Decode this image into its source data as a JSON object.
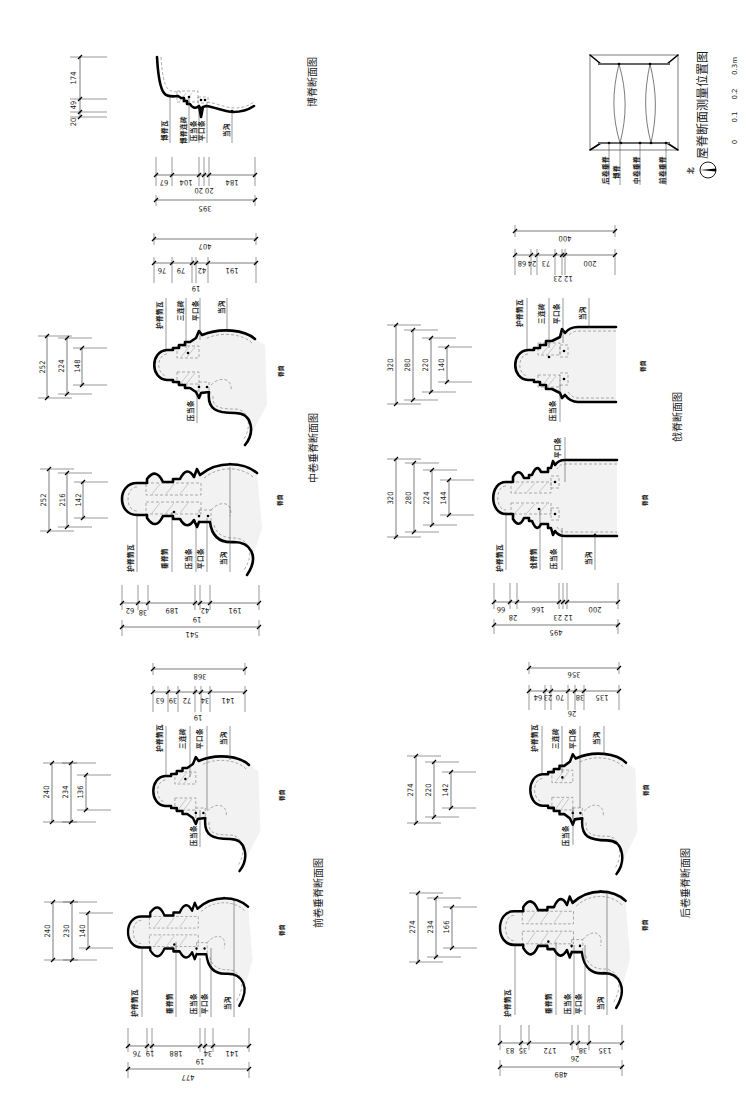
{
  "sheet": {
    "boji": {
      "title": "博脊断面图",
      "labels": [
        "博脊瓦",
        "博脊连砖",
        "压当条",
        "平口条",
        "当沟"
      ],
      "height_dims": [
        "174",
        "49",
        "20"
      ],
      "width_dims": [
        "67",
        "104",
        "20 20",
        "184"
      ],
      "width_total": "395"
    },
    "zhongjuan": {
      "title": "中卷垂脊断面图",
      "short": {
        "labels": [
          "护脊筒瓦",
          "三连砖",
          "平口条",
          "当沟",
          "压当条"
        ],
        "body_label": "脊筒",
        "height_dims": [
          "252",
          "224",
          "148"
        ],
        "width_dims": [
          "76",
          "79",
          "42",
          "191"
        ],
        "width_sub": "19",
        "width_total": "407"
      },
      "long": {
        "labels": [
          "护脊筒瓦",
          "垂脊筒",
          "压当条",
          "平口条",
          "当沟"
        ],
        "body_label": "脊筒",
        "height_dims": [
          "252",
          "216",
          "142"
        ],
        "width_dims": [
          "62",
          "38",
          "189",
          "42",
          "191"
        ],
        "width_sub": "19",
        "width_total": "541"
      }
    },
    "qianjuan": {
      "title": "前卷垂脊断面图",
      "short": {
        "labels": [
          "护脊筒瓦",
          "三连砖",
          "平口条",
          "当沟",
          "压当条"
        ],
        "body_label": "脊筒",
        "height_dims": [
          "240",
          "234",
          "136"
        ],
        "width_dims": [
          "63",
          "39",
          "72",
          "34",
          "141"
        ],
        "width_sub": "19",
        "width_total": "368"
      },
      "long": {
        "labels": [
          "护脊筒瓦",
          "垂脊筒",
          "压当条",
          "平口条",
          "当沟"
        ],
        "body_label": "脊筒",
        "height_dims": [
          "240",
          "230",
          "140"
        ],
        "width_dims": [
          "76",
          "19",
          "188",
          "34",
          "141"
        ],
        "width_sub": "19",
        "width_total": "477"
      }
    },
    "qiangji": {
      "title": "戗脊断面图",
      "short": {
        "labels": [
          "护脊筒瓦",
          "三连砖",
          "平口条",
          "当沟",
          "压当条"
        ],
        "body_label": "脊筒",
        "height_dims": [
          "320",
          "280",
          "220",
          "140"
        ],
        "width_dims": [
          "68",
          "24",
          "73",
          "200"
        ],
        "width_sub": "12 23",
        "width_total": "400"
      },
      "long": {
        "labels": [
          "护脊筒瓦",
          "戗脊筒",
          "压当条",
          "当沟",
          "平口条"
        ],
        "body_label": "脊筒",
        "height_dims": [
          "320",
          "280",
          "224",
          "144"
        ],
        "width_dims": [
          "66",
          "28",
          "166",
          "200"
        ],
        "width_sub": "12 23",
        "width_total": "495"
      }
    },
    "houjuan": {
      "title": "后卷垂脊断面图",
      "short": {
        "labels": [
          "护脊筒瓦",
          "三连砖",
          "平口条",
          "当沟",
          "压当条"
        ],
        "body_label": "脊筒",
        "height_dims": [
          "274",
          "220",
          "142"
        ],
        "width_dims": [
          "64",
          "23",
          "70",
          "38",
          "135"
        ],
        "width_sub": "26",
        "width_total": "356"
      },
      "long": {
        "labels": [
          "护脊筒瓦",
          "垂脊筒",
          "压当条",
          "平口条",
          "当沟"
        ],
        "body_label": "脊筒",
        "height_dims": [
          "274",
          "234",
          "166"
        ],
        "width_dims": [
          "83",
          "35",
          "172",
          "38",
          "135"
        ],
        "width_sub": "26",
        "width_total": "489"
      }
    }
  },
  "location_plan": {
    "title": "屋脊断面测量位置图",
    "labels": [
      "后卷垂脊",
      "博脊",
      "中卷垂脊",
      "前卷垂脊"
    ],
    "north_label": "北",
    "north_icon": "north-arrow-icon"
  },
  "scale_bar": {
    "ticks": [
      "0",
      "0.1",
      "0.2",
      "0.3m"
    ]
  }
}
